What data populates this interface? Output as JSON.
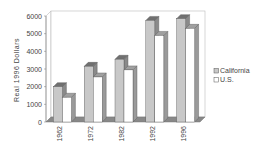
{
  "chart_data": {
    "type": "bar",
    "style": "3d-clustered-column",
    "title": "",
    "xlabel": "",
    "ylabel": "Real 1996 Dollars",
    "ylim": [
      0,
      6000
    ],
    "yticks": [
      0,
      1000,
      2000,
      3000,
      4000,
      5000,
      6000
    ],
    "grid": false,
    "legend_position": "right",
    "categories": [
      "1962",
      "1972",
      "1982",
      "1992",
      "1996"
    ],
    "series": [
      {
        "name": "California",
        "color": "#c8c8c8",
        "values": [
          2000,
          3150,
          3550,
          5750,
          5850
        ]
      },
      {
        "name": "U.S.",
        "color": "#ffffff",
        "values": [
          1400,
          2550,
          2950,
          4900,
          5300
        ]
      }
    ]
  },
  "legend": {
    "items": [
      "California",
      "U.S."
    ]
  },
  "axis": {
    "ylabel": "Real 1996 Dollars"
  }
}
